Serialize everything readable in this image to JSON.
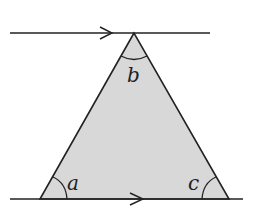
{
  "diagram": {
    "colors": {
      "stroke": "#222222",
      "fill": "#d8d8d8",
      "background": "#ffffff"
    },
    "top_line": {
      "x1": 10,
      "x2": 210,
      "y": 33,
      "arrow_x": 112
    },
    "bottom_line": {
      "x1": 10,
      "x2": 243,
      "y": 199,
      "arrow_x": 143
    },
    "triangle": {
      "apex": [
        134,
        33
      ],
      "bottom_left": [
        40,
        199
      ],
      "bottom_right": [
        229,
        199
      ]
    },
    "angles": {
      "a": {
        "label": "a",
        "x": 67,
        "y": 190
      },
      "b": {
        "label": "b",
        "x": 127,
        "y": 82
      },
      "c": {
        "label": "c",
        "x": 188,
        "y": 190
      }
    }
  }
}
